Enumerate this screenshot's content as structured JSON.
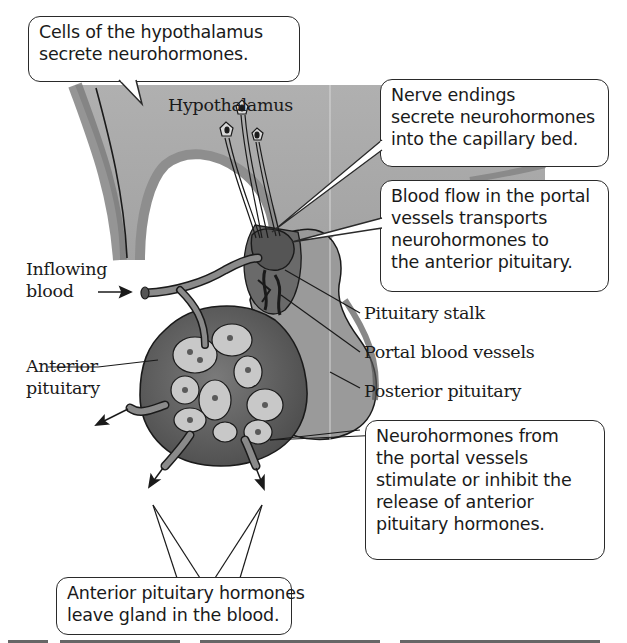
{
  "figure": {
    "title_label": "Hypothalamus",
    "callouts": {
      "hypothalamus_cells": [
        "Cells of the hypothalamus",
        "secrete neurohormones."
      ],
      "nerve_endings": [
        "Nerve endings",
        "secrete neurohormones",
        "into the capillary bed."
      ],
      "blood_flow": [
        "Blood flow in the portal",
        "vessels transports",
        "neurohormones to",
        "the anterior pituitary."
      ],
      "neurohormones_effect": [
        "Neurohormones from",
        "the portal vessels",
        "stimulate or inhibit the",
        "release of anterior",
        "pituitary hormones."
      ],
      "hormones_leave": [
        "Anterior pituitary hormones",
        "leave gland in the blood."
      ]
    },
    "labels": {
      "inflowing_blood": [
        "Inflowing",
        "blood"
      ],
      "anterior_pituitary": [
        "Anterior",
        "pituitary"
      ],
      "pituitary_stalk": "Pituitary stalk",
      "portal_blood_vessels": "Portal blood vessels",
      "posterior_pituitary": "Posterior pituitary"
    },
    "colors": {
      "hypothalamus_fill": "#a9a9a9",
      "hypothalamus_edge": "#8a8a8a",
      "anterior_fill": "#6e6e6e",
      "anterior_dark": "#4a4a4a",
      "posterior_fill": "#9a9a9a",
      "cell_fill": "#c8c8c8",
      "outline": "#1a1a1a"
    }
  }
}
